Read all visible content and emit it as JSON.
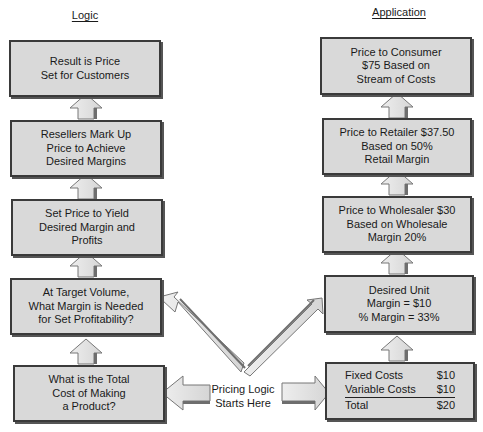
{
  "diagram": {
    "columns": {
      "left_header": "Logic",
      "right_header": "Application"
    },
    "logic_steps": [
      {
        "text": "Result is Price\nSet for Customers"
      },
      {
        "text": "Resellers Mark Up\nPrice to Achieve\nDesired Margins"
      },
      {
        "text": "Set Price to Yield\nDesired Margin and\nProfits"
      },
      {
        "text": "At Target Volume,\nWhat Margin is Needed\nfor Set Profitability?"
      },
      {
        "text": "What is the Total\nCost of Making\na Product?"
      }
    ],
    "application_steps": [
      {
        "text": "Price to Consumer\n$75 Based on\nStream of Costs"
      },
      {
        "text": "Price to Retailer $37.50\nBased on 50%\nRetail Margin"
      },
      {
        "text": "Price to Wholesaler $30\nBased on Wholesale\nMargin 20%"
      },
      {
        "text": "Desired Unit\nMargin = $10\n% Margin = 33%"
      }
    ],
    "cost_box": {
      "rows": [
        {
          "label": "Fixed Costs",
          "value": "$10"
        },
        {
          "label": "Variable Costs",
          "value": "$10"
        }
      ],
      "total": {
        "label": "Total",
        "value": "$20"
      }
    },
    "start_label": "Pricing Logic\nStarts Here",
    "colors": {
      "box_fill": "#d9d9d9",
      "box_border": "#3a3a3a",
      "arrow_fill": "#e6e6e6",
      "arrow_shadow": "#6e6e6e"
    }
  }
}
